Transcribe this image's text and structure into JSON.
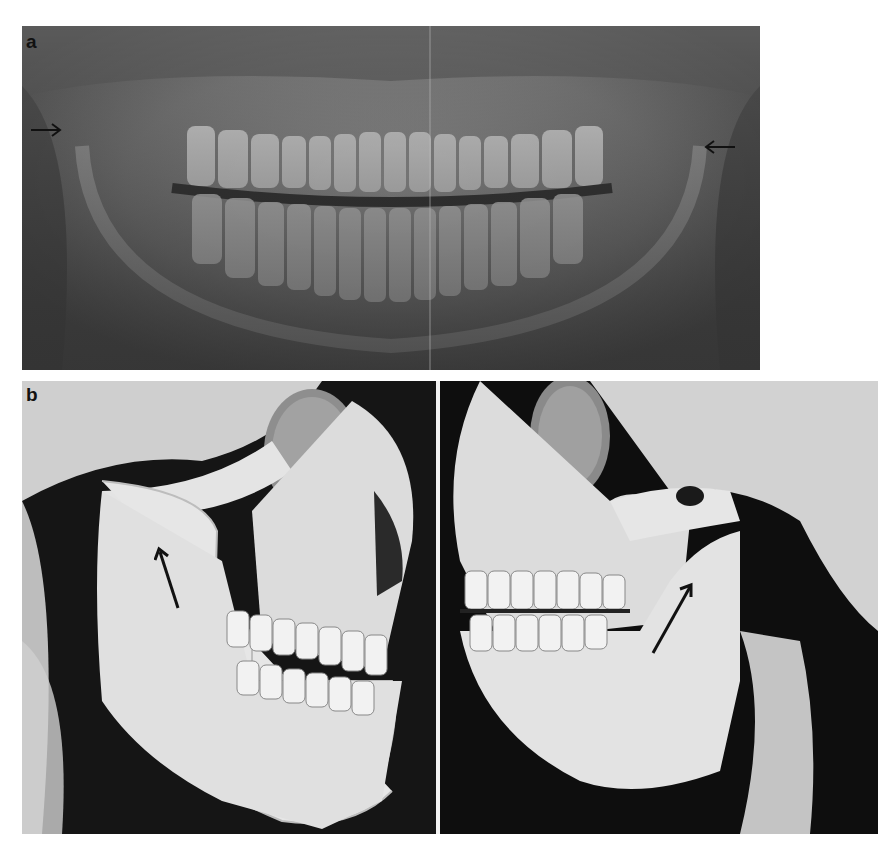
{
  "figure": {
    "panel_a": {
      "label": "a",
      "type": "panoramic radiograph",
      "arrows": [
        {
          "side": "right-of-image-left",
          "direction": "right"
        },
        {
          "side": "left-of-image-right",
          "direction": "left"
        }
      ]
    },
    "panel_b": {
      "label": "b",
      "type": "3D CT reconstruction",
      "views": [
        {
          "side": "left",
          "arrow_direction": "up"
        },
        {
          "side": "right",
          "arrow_direction": "up-right"
        }
      ]
    }
  }
}
